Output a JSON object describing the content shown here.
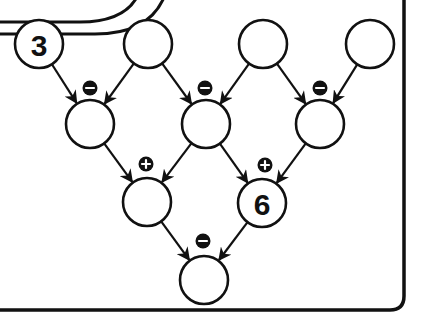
{
  "puzzle": {
    "type": "arithmetic-pyramid",
    "rows": [
      [
        {
          "id": "r0c0",
          "value": "3"
        },
        {
          "id": "r0c1",
          "value": ""
        },
        {
          "id": "r0c2",
          "value": ""
        },
        {
          "id": "r0c3",
          "value": ""
        }
      ],
      [
        {
          "id": "r1c0",
          "value": "",
          "operator": "minus"
        },
        {
          "id": "r1c1",
          "value": "",
          "operator": "minus"
        },
        {
          "id": "r1c2",
          "value": "",
          "operator": "minus"
        }
      ],
      [
        {
          "id": "r2c0",
          "value": "",
          "operator": "plus"
        },
        {
          "id": "r2c1",
          "value": "6",
          "operator": "plus"
        }
      ],
      [
        {
          "id": "r3c0",
          "value": "",
          "operator": "minus"
        }
      ]
    ],
    "operator_symbols": {
      "minus": "−",
      "plus": "+"
    }
  },
  "colors": {
    "ink": "#111111",
    "background": "#ffffff"
  }
}
